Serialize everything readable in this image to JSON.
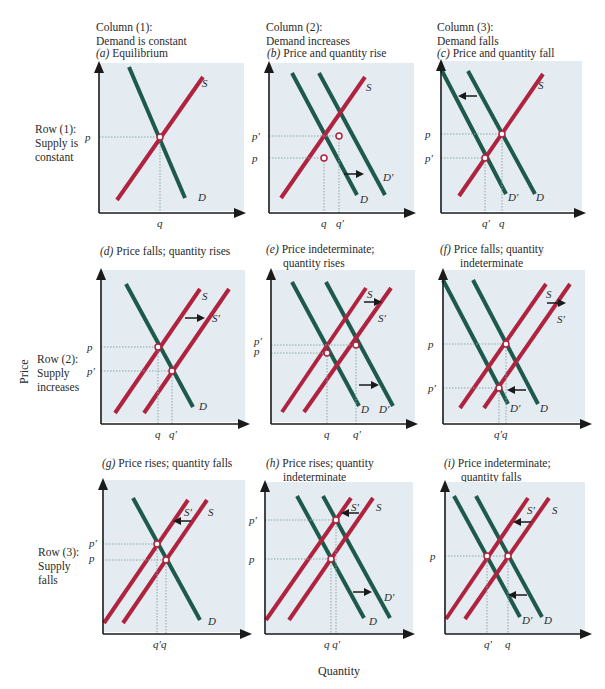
{
  "columns": [
    {
      "line1": "Column (1):",
      "line2": "Demand is constant"
    },
    {
      "line1": "Column (2):",
      "line2": "Demand increases"
    },
    {
      "line1": "Column (3):",
      "line2": "Demand falls"
    }
  ],
  "rows": [
    {
      "line1": "Row (1):",
      "line2": "Supply is",
      "line3": "constant"
    },
    {
      "line1": "Row (2):",
      "line2": "Supply",
      "line3": "increases"
    },
    {
      "line1": "Row (3):",
      "line2": "Supply",
      "line3": "falls"
    }
  ],
  "axes": {
    "y_title": "Price",
    "x_title": "Quantity"
  },
  "colors": {
    "background": "#e4ebf1",
    "supply": "#b0233f",
    "demand": "#1d5a4c",
    "axis": "#1a1a1a"
  },
  "panels": [
    {
      "id": "a",
      "letter": "(a)",
      "caption1": "Equilibrium",
      "caption2": ""
    },
    {
      "id": "b",
      "letter": "(b)",
      "caption1": "Price and quantity rise",
      "caption2": ""
    },
    {
      "id": "c",
      "letter": "(c)",
      "caption1": "Price and quantity fall",
      "caption2": ""
    },
    {
      "id": "d",
      "letter": "(d)",
      "caption1": "Price falls; quantity rises",
      "caption2": ""
    },
    {
      "id": "e",
      "letter": "(e)",
      "caption1": "Price indeterminate;",
      "caption2": "quantity rises"
    },
    {
      "id": "f",
      "letter": "(f)",
      "caption1": "Price falls; quantity",
      "caption2": "indeterminate"
    },
    {
      "id": "g",
      "letter": "(g)",
      "caption1": "Price rises; quantity falls",
      "caption2": ""
    },
    {
      "id": "h",
      "letter": "(h)",
      "caption1": "Price rises; quantity",
      "caption2": "indeterminate"
    },
    {
      "id": "i",
      "letter": "(i)",
      "caption1": "Price indeterminate;",
      "caption2": "quantity falls"
    }
  ],
  "labels": {
    "S": "S",
    "S_prime": "S′",
    "D": "D",
    "D_prime": "D′",
    "p": "p",
    "p_prime": "p′",
    "q": "q",
    "q_prime": "q′",
    "q_prime_q": "q′q",
    "q_q_prime": "q q′"
  }
}
